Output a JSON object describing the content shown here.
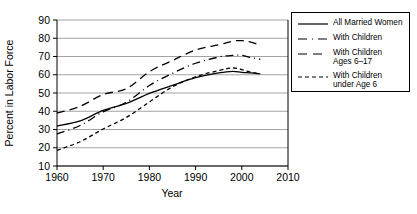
{
  "chart_data": {
    "type": "line",
    "title": "",
    "xlabel": "Year",
    "ylabel": "Percent in Labor Force",
    "xlim": [
      1960,
      2010
    ],
    "ylim": [
      10,
      90
    ],
    "xticks": [
      1960,
      1970,
      1980,
      1990,
      2000,
      2010
    ],
    "yticks": [
      10,
      20,
      30,
      40,
      50,
      60,
      70,
      80,
      90
    ],
    "grid": "horizontal",
    "legend_position": "right-outside",
    "x": [
      1960,
      1965,
      1970,
      1975,
      1980,
      1985,
      1990,
      1995,
      1998,
      2000,
      2002,
      2004
    ],
    "series": [
      {
        "name": "All Married Women",
        "style": "solid",
        "values": [
          31.9,
          34.7,
          40.5,
          44.3,
          49.8,
          54.2,
          58.4,
          61.0,
          61.9,
          61.3,
          61.0,
          60.5
        ]
      },
      {
        "name": "With Children",
        "style": "dash-dot",
        "values": [
          27.6,
          32.2,
          39.7,
          44.9,
          54.1,
          60.8,
          66.3,
          69.7,
          70.6,
          70.6,
          69.4,
          68.5
        ]
      },
      {
        "name": "With Children Ages 6–17",
        "style": "long-dash",
        "values": [
          39.0,
          42.7,
          49.2,
          52.3,
          61.7,
          67.8,
          73.6,
          76.4,
          78.4,
          78.7,
          77.9,
          76.2
        ]
      },
      {
        "name": "With Children under Age 6",
        "style": "dashed",
        "values": [
          18.6,
          23.3,
          30.3,
          36.6,
          45.1,
          53.4,
          58.9,
          62.3,
          63.7,
          62.8,
          61.4,
          60.3
        ]
      }
    ]
  },
  "axes": {
    "y_title": "Percent in Labor Force",
    "x_title": "Year",
    "y_tick_labels": [
      "90",
      "80",
      "70",
      "60",
      "50",
      "40",
      "30",
      "20",
      "10"
    ],
    "x_tick_labels": [
      "1960",
      "1970",
      "1980",
      "1990",
      "2000",
      "2010"
    ]
  },
  "legend": {
    "items": [
      {
        "label": "All Married Women",
        "style": "solid"
      },
      {
        "label": "With Children",
        "style": "dash-dot"
      },
      {
        "label": "With Children\nAges 6–17",
        "style": "long-dash"
      },
      {
        "label": "With Children\nunder Age 6",
        "style": "dashed"
      }
    ]
  },
  "colors": {
    "line": "#000000",
    "grid": "#808080",
    "axis": "#000000",
    "background": "#ffffff"
  }
}
